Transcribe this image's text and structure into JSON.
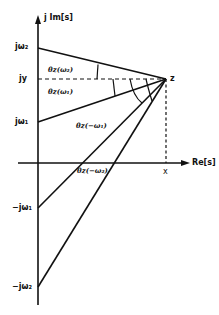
{
  "diagram": {
    "type": "complex-plane-angle-diagram",
    "axes": {
      "imag_label": "j Im[s]",
      "real_label": "Re[s]"
    },
    "point": {
      "label": "z",
      "x_label": "x",
      "y_label": "jy"
    },
    "imag_ticks": [
      {
        "id": "jw2",
        "label": "jω₂"
      },
      {
        "id": "jy",
        "label": "jy"
      },
      {
        "id": "jw1",
        "label": "jω₁"
      },
      {
        "id": "neg_jw1",
        "label": "−jω₁"
      },
      {
        "id": "neg_jw2",
        "label": "−jω₂"
      }
    ],
    "angles": [
      {
        "id": "theta_w2",
        "label": "θz(ω₂)"
      },
      {
        "id": "theta_w1",
        "label": "θz(ω₁)"
      },
      {
        "id": "theta_neg_w1",
        "label": "θz(−ω₁)"
      },
      {
        "id": "theta_neg_w2",
        "label": "θz(−ω₂)"
      }
    ],
    "colors": {
      "ink": "#111111",
      "background": "#ffffff"
    }
  }
}
